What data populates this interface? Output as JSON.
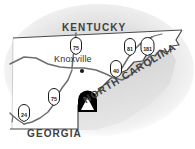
{
  "map": {
    "title": "Eastern Tennessee locator map",
    "region": "Tennessee",
    "background_color": "#ffffff",
    "land_fill": "#ffffff",
    "halo_color": "#e8e8e8",
    "outline_color": "#4a4a4a",
    "road_color": "#6e6e6e",
    "label_color": "#404040",
    "states": [
      {
        "id": "kentucky",
        "label": "KENTUCKY"
      },
      {
        "id": "north-carolina",
        "label": "NORTH CAROLINA"
      },
      {
        "id": "georgia",
        "label": "GEORGIA"
      }
    ],
    "cities": [
      {
        "id": "knoxville",
        "label": "Knoxville"
      }
    ],
    "highway_shields": [
      {
        "id": "i-75-north",
        "label": "75",
        "type": "interstate"
      },
      {
        "id": "i-81",
        "label": "81",
        "type": "interstate"
      },
      {
        "id": "i-181",
        "label": "181",
        "type": "interstate"
      },
      {
        "id": "i-40",
        "label": "40",
        "type": "interstate"
      },
      {
        "id": "i-75-south",
        "label": "75",
        "type": "interstate"
      },
      {
        "id": "i-24",
        "label": "24",
        "type": "interstate"
      }
    ],
    "markers": [
      {
        "id": "park-marker",
        "icon": "triangle-park-marker",
        "fill": "#000000"
      },
      {
        "id": "knoxville-dot",
        "icon": "city-dot",
        "fill": "#1a1a1a"
      }
    ]
  }
}
